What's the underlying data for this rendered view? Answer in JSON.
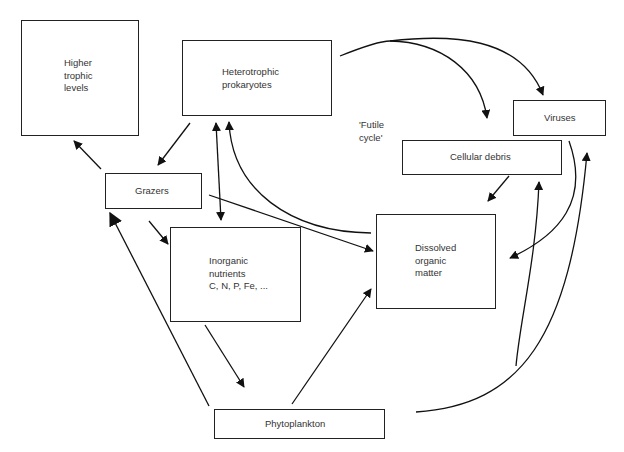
{
  "diagram": {
    "nodes": {
      "higher_trophic": {
        "label": "Higher\ntrophic\nlevels"
      },
      "heterotrophic": {
        "label": "Heterotrophic\nprokaryotes"
      },
      "viruses": {
        "label": "Viruses"
      },
      "cellular_debris": {
        "label": "Cellular debris"
      },
      "grazers": {
        "label": "Grazers"
      },
      "inorganic": {
        "label": "Inorganic\nnutrients\nC, N, P, Fe, ..."
      },
      "dom": {
        "label": "Dissolved\norganic\nmatter"
      },
      "phytoplankton": {
        "label": "Phytoplankton"
      }
    },
    "annotations": {
      "futile_cycle": "'Futile\ncycle'"
    },
    "edges": [
      {
        "from": "Grazers",
        "to": "Higher trophic levels"
      },
      {
        "from": "Heterotrophic prokaryotes",
        "to": "Grazers"
      },
      {
        "from": "Heterotrophic prokaryotes",
        "to": "Inorganic nutrients",
        "bidirectional": true
      },
      {
        "from": "Dissolved organic matter",
        "to": "Heterotrophic prokaryotes"
      },
      {
        "from": "Heterotrophic prokaryotes",
        "to": "Cellular debris"
      },
      {
        "from": "Heterotrophic prokaryotes",
        "to": "Viruses"
      },
      {
        "from": "Grazers",
        "to": "Inorganic nutrients"
      },
      {
        "from": "Grazers",
        "to": "Dissolved organic matter"
      },
      {
        "from": "Inorganic nutrients",
        "to": "Phytoplankton"
      },
      {
        "from": "Phytoplankton",
        "to": "Grazers"
      },
      {
        "from": "Phytoplankton",
        "to": "Dissolved organic matter"
      },
      {
        "from": "Cellular debris",
        "to": "Dissolved organic matter"
      },
      {
        "from": "Viruses",
        "to": "Dissolved organic matter"
      },
      {
        "from": "Phytoplankton",
        "to": "Cellular debris"
      },
      {
        "from": "Phytoplankton",
        "to": "Viruses"
      }
    ]
  }
}
